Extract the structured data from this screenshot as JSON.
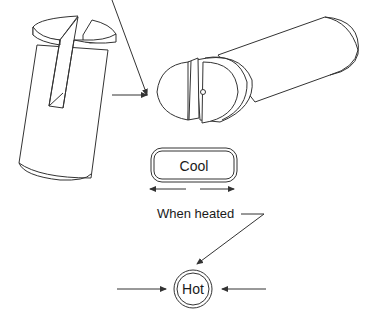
{
  "diagram": {
    "labels": {
      "cool": "Cool",
      "when_heated": "When heated",
      "hot": "Hot"
    },
    "colors": {
      "line": "#333333",
      "background": "#ffffff",
      "text": "#1a1a1a"
    }
  }
}
